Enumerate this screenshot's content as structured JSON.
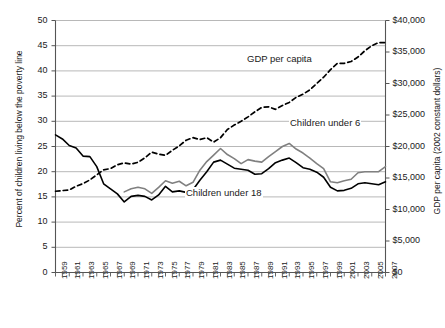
{
  "chart_data": {
    "type": "line",
    "title": "",
    "xlabel": "",
    "x": [
      1959,
      1960,
      1961,
      1962,
      1963,
      1964,
      1965,
      1966,
      1967,
      1968,
      1969,
      1970,
      1971,
      1972,
      1973,
      1974,
      1975,
      1976,
      1977,
      1978,
      1979,
      1980,
      1981,
      1982,
      1983,
      1984,
      1985,
      1986,
      1987,
      1988,
      1989,
      1990,
      1991,
      1992,
      1993,
      1994,
      1995,
      1996,
      1997,
      1998,
      1999,
      2000,
      2001,
      2002,
      2003,
      2004,
      2005,
      2006,
      2007
    ],
    "xtick_labels": [
      "1959",
      "1961",
      "1963",
      "1965",
      "1967",
      "1969",
      "1971",
      "1973",
      "1975",
      "1977",
      "1979",
      "1981",
      "1983",
      "1985",
      "1987",
      "1989",
      "1991",
      "1993",
      "1995",
      "1997",
      "1999",
      "2001",
      "2003",
      "2005",
      "2007"
    ],
    "grid": true,
    "legend_position": "inline-annotations",
    "axes": [
      {
        "id": "left",
        "label": "Percent of children living below the poverty line",
        "ylim": [
          0,
          50
        ],
        "ticks": [
          0,
          5,
          10,
          15,
          20,
          25,
          30,
          35,
          40,
          45,
          50
        ],
        "tick_labels": [
          "0",
          "5",
          "10",
          "15",
          "20",
          "25",
          "30",
          "35",
          "40",
          "45",
          "50"
        ]
      },
      {
        "id": "right",
        "label": "GDP per capita (2002 constant dollars)",
        "ylim": [
          0,
          40000
        ],
        "ticks": [
          0,
          5000,
          10000,
          15000,
          20000,
          25000,
          30000,
          35000,
          40000
        ],
        "tick_labels": [
          "$0",
          "$5,000",
          "$10,000",
          "$15,000",
          "$20,000",
          "$25,000",
          "$30,000",
          "$35,000",
          "$40,000"
        ]
      }
    ],
    "series": [
      {
        "name": "Children under 18",
        "axis": "left",
        "color": "#000000",
        "style": "solid",
        "unit": "percent",
        "label_text": "Children under 18",
        "values": [
          27.3,
          26.5,
          25.2,
          24.7,
          23.1,
          23.0,
          21.0,
          17.6,
          16.6,
          15.6,
          14.0,
          15.1,
          15.3,
          15.1,
          14.4,
          15.4,
          17.1,
          16.0,
          16.2,
          15.9,
          16.4,
          18.3,
          20.0,
          21.9,
          22.3,
          21.5,
          20.7,
          20.5,
          20.3,
          19.5,
          19.6,
          20.6,
          21.8,
          22.3,
          22.7,
          21.8,
          20.8,
          20.5,
          19.9,
          18.9,
          16.9,
          16.2,
          16.3,
          16.7,
          17.6,
          17.8,
          17.6,
          17.4,
          18.0
        ]
      },
      {
        "name": "Children under 6",
        "axis": "left",
        "color": "#808080",
        "style": "solid",
        "unit": "percent",
        "label_text": "Children under 6",
        "values": [
          null,
          null,
          null,
          null,
          null,
          null,
          null,
          null,
          null,
          null,
          16.0,
          16.6,
          16.9,
          16.6,
          15.7,
          16.9,
          18.2,
          17.7,
          18.1,
          17.2,
          17.9,
          20.3,
          22.0,
          23.3,
          24.6,
          23.4,
          22.6,
          21.6,
          22.4,
          22.1,
          21.9,
          23.0,
          24.0,
          25.0,
          25.6,
          24.5,
          23.7,
          22.7,
          21.6,
          20.6,
          18.0,
          17.8,
          18.2,
          18.5,
          19.8,
          20.0,
          20.0,
          20.0,
          21.0
        ]
      },
      {
        "name": "GDP per capita",
        "axis": "right",
        "color": "#000000",
        "style": "dashed",
        "unit": "dollars",
        "label_text": "GDP per capita",
        "values": [
          12900,
          13000,
          13100,
          13700,
          14100,
          14700,
          15500,
          16300,
          16500,
          17100,
          17400,
          17200,
          17500,
          18200,
          19100,
          18800,
          18600,
          19400,
          20100,
          21000,
          21400,
          21100,
          21400,
          20700,
          21400,
          22700,
          23400,
          24000,
          24700,
          25500,
          26200,
          26300,
          25900,
          26500,
          27000,
          27800,
          28300,
          29000,
          30000,
          31000,
          32200,
          33200,
          33200,
          33500,
          34200,
          35200,
          36000,
          36500,
          36500
        ]
      }
    ],
    "annotations": [
      {
        "text": "GDP per capita",
        "x": 1986,
        "y_axis": "right"
      },
      {
        "text": "Children under 6",
        "x": 1996,
        "y_axis": "left"
      },
      {
        "text": "Children under 18",
        "x": 1981,
        "y_axis": "left"
      }
    ]
  },
  "labels": {
    "left_axis_title": "Percent of children living below the poverty line",
    "right_axis_title": "GDP per capita (2002 constant dollars)",
    "gdp_label": "GDP per capita",
    "under6_label": "Children under 6",
    "under18_label": "Children under 18"
  }
}
